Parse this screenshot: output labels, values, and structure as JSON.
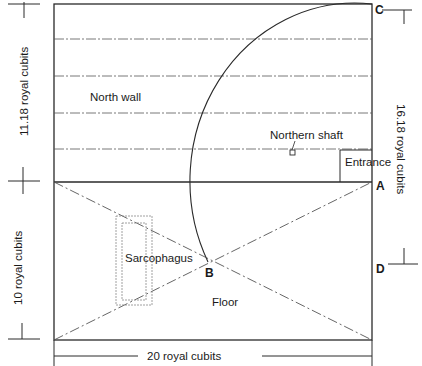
{
  "diagram": {
    "labels": {
      "north_wall": "North wall",
      "northern_shaft": "Northern shaft",
      "entrance": "Entrance",
      "sarcophagus": "Sarcophagus",
      "floor": "Floor"
    },
    "points": {
      "a": "A",
      "b": "B",
      "c": "C",
      "d": "D"
    },
    "dimensions": {
      "wall_height": "11.18 royal cubits",
      "floor_width": "10 royal cubits",
      "floor_length": "20 royal cubits",
      "diagonal_total": "16.18 royal cubits"
    },
    "colors": {
      "line": "#2a2a2a",
      "dashed": "#555555",
      "background": "#ffffff"
    }
  }
}
